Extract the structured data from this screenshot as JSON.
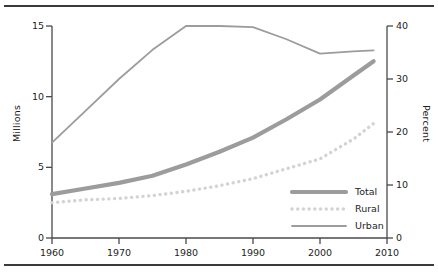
{
  "chart_data": {
    "type": "line",
    "title": "",
    "xlabel": "",
    "ylabel": "Millions",
    "y2label": "Percent",
    "xlim": [
      1960,
      2010
    ],
    "ylim": [
      0,
      15
    ],
    "y2lim": [
      0,
      40
    ],
    "grid": false,
    "legend_position": "bottom-right",
    "xticks": [
      "1960",
      "1970",
      "1980",
      "1990",
      "2000",
      "2010"
    ],
    "xtick_values": [
      1960,
      1970,
      1980,
      1990,
      2000,
      2010
    ],
    "yticks_left": [
      "0",
      "5",
      "10",
      "15"
    ],
    "ytick_left_values": [
      0,
      5,
      10,
      15
    ],
    "yticks_right": [
      "0",
      "10",
      "20",
      "30",
      "40"
    ],
    "ytick_right_values": [
      0,
      10,
      20,
      30,
      40
    ],
    "x": [
      1960,
      1965,
      1970,
      1975,
      1980,
      1985,
      1990,
      1995,
      2000,
      2005,
      2008
    ],
    "series": [
      {
        "name": "Total",
        "axis": "left",
        "unit": "Millions",
        "style": "solid-thick",
        "color": "#9c9c9c",
        "values": [
          3.1,
          3.5,
          3.9,
          4.4,
          5.2,
          6.1,
          7.1,
          8.4,
          9.8,
          11.5,
          12.5
        ]
      },
      {
        "name": "Rural",
        "axis": "left",
        "unit": "Millions",
        "style": "dotted",
        "color": "#d3d3d3",
        "values": [
          2.5,
          2.7,
          2.8,
          3.0,
          3.3,
          3.7,
          4.2,
          4.9,
          5.6,
          7.0,
          8.1
        ]
      },
      {
        "name": "Urban",
        "axis": "right",
        "unit": "Percent",
        "style": "solid-thin",
        "color": "#9c9c9c",
        "values": [
          18.0,
          24.0,
          30.0,
          35.5,
          40.0,
          40.0,
          39.8,
          37.5,
          34.8,
          35.2,
          35.4
        ]
      }
    ]
  },
  "axes": {
    "left_title": "Millions",
    "right_title": "Percent"
  },
  "legend": {
    "items": [
      {
        "label": "Total",
        "swatch": "solid-thick-line-swatch"
      },
      {
        "label": "Rural",
        "swatch": "dotted-line-swatch"
      },
      {
        "label": "Urban",
        "swatch": "solid-thin-line-swatch"
      }
    ]
  },
  "colors": {
    "total": "#9c9c9c",
    "rural": "#d3d3d3",
    "urban": "#9c9c9c",
    "axis": "#4a4a4a",
    "text": "#1d1d1d",
    "rule": "#3a3a3a"
  }
}
